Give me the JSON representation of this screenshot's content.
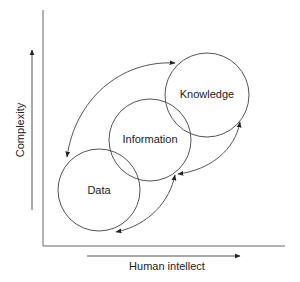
{
  "diagram": {
    "y_axis_label": "Complexity",
    "x_axis_label": "Human intellect",
    "nodes": [
      {
        "id": "data",
        "label": "Data"
      },
      {
        "id": "information",
        "label": "Information"
      },
      {
        "id": "knowledge",
        "label": "Knowledge"
      }
    ],
    "edges": [
      {
        "from": "knowledge",
        "to": "data",
        "style": "curved-bidirectional"
      },
      {
        "from": "data",
        "to": "information",
        "style": "curved"
      },
      {
        "from": "knowledge",
        "to": "information",
        "style": "curved"
      },
      {
        "from": "information",
        "to": "knowledge",
        "style": "curved"
      }
    ],
    "colors": {
      "stroke": "#555555",
      "text": "#222222",
      "background": "#ffffff"
    }
  }
}
